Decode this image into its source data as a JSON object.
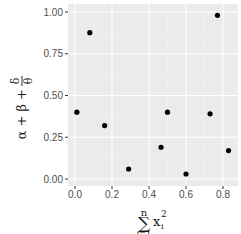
{
  "chart_data": {
    "type": "scatter",
    "title": "",
    "xlabel": "sum_{i=1}^{n} x_i^2",
    "ylabel": "alpha + beta + delta/theta",
    "xlabel_parts": {
      "sum": "∑",
      "upper": "n",
      "lower": "i=1",
      "var": "x",
      "sup": "2",
      "sub": "i"
    },
    "ylabel_parts": {
      "lhs": "α + β + ",
      "num": "δ",
      "den": "θ"
    },
    "x_ticks": [
      0.0,
      0.2,
      0.4,
      0.6,
      0.8
    ],
    "x_tick_labels": [
      "0.0",
      "0.2",
      "0.4",
      "0.6",
      "0.8"
    ],
    "y_ticks": [
      0.0,
      0.25,
      0.5,
      0.75,
      1.0
    ],
    "y_tick_labels": [
      "0.00",
      "0.25",
      "0.50",
      "0.75",
      "1.00"
    ],
    "xlim": [
      -0.04,
      0.86
    ],
    "ylim": [
      -0.04,
      1.05
    ],
    "grid": true,
    "legend": "none",
    "points": [
      {
        "x": 0.01,
        "y": 0.4
      },
      {
        "x": 0.08,
        "y": 0.876
      },
      {
        "x": 0.16,
        "y": 0.32
      },
      {
        "x": 0.29,
        "y": 0.06
      },
      {
        "x": 0.465,
        "y": 0.19
      },
      {
        "x": 0.5,
        "y": 0.4
      },
      {
        "x": 0.6,
        "y": 0.03
      },
      {
        "x": 0.73,
        "y": 0.39
      },
      {
        "x": 0.77,
        "y": 0.98
      },
      {
        "x": 0.83,
        "y": 0.17
      }
    ],
    "colors": {
      "panel": "#ebebeb",
      "grid_major": "#ffffff",
      "grid_minor": "#f5f5f5",
      "point": "#000000",
      "tick": "#333333"
    }
  }
}
